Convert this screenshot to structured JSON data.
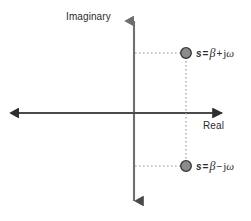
{
  "figure": {
    "background_color": "#ffffff",
    "width": 251,
    "height": 221
  },
  "axes": {
    "imaginary": {
      "label": "Imaginary",
      "color": "#6e6e6e",
      "orientation": "vertical",
      "x": 134,
      "y_top": 16,
      "y_bottom": 207,
      "arrow_ends": "both"
    },
    "real": {
      "label": "Real",
      "color": "#4a4a4a",
      "orientation": "horizontal",
      "y": 113,
      "x_left": 13,
      "x_right": 228,
      "arrow_ends": "both"
    },
    "origin": {
      "x": 134,
      "y": 113
    }
  },
  "markers": {
    "fill_color": "#8c8c8c",
    "stroke_color": "#333333",
    "radius": 5.5,
    "points": [
      {
        "name": "pole-upper",
        "x": 186,
        "y": 53,
        "label_parts": {
          "variable": "s",
          "equals": "=",
          "real_part": "β",
          "operator": "+",
          "imag_unit": "j",
          "imag_part": "ω"
        },
        "label_text": "s = β + jω"
      },
      {
        "name": "pole-lower",
        "x": 186,
        "y": 166,
        "label_parts": {
          "variable": "s",
          "equals": "=",
          "real_part": "β",
          "operator": "−",
          "imag_unit": "j",
          "imag_part": "ω"
        },
        "label_text": "s = β − jω"
      }
    ]
  },
  "guides": {
    "color": "#9a9a9a",
    "style": "dotted",
    "lines": [
      {
        "name": "projection-upper-horizontal",
        "x1": 135,
        "y1": 53,
        "x2": 186,
        "y2": 53
      },
      {
        "name": "projection-lower-horizontal",
        "x1": 135,
        "y1": 166,
        "x2": 186,
        "y2": 166
      },
      {
        "name": "projection-vertical",
        "x1": 186,
        "y1": 53,
        "x2": 186,
        "y2": 166
      }
    ]
  }
}
